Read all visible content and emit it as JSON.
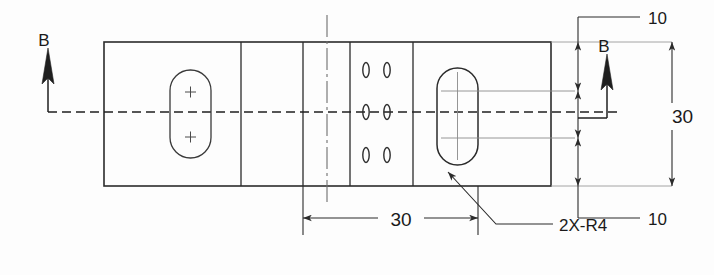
{
  "drawing": {
    "type": "engineering-drawing",
    "title": "",
    "background_color": "#fdfdfd",
    "line_color": "#2b2b2b",
    "thin_line_color": "#565656",
    "text_color": "#1a1a1a",
    "view": {
      "name": "front-view",
      "outline": {
        "x": 104,
        "y": 42,
        "width": 447,
        "height": 144
      },
      "dividers_x": [
        241,
        303,
        350,
        413
      ]
    },
    "centerlines": {
      "horizontal": {
        "y": 112,
        "x1": 48,
        "x2": 620,
        "style": "dash-dot"
      },
      "vertical": {
        "x": 327,
        "y1": 15,
        "y2": 205,
        "style": "dash-dot"
      }
    },
    "features": {
      "left_slot": {
        "label": "left-obround-slot",
        "x": 170,
        "y": 70,
        "width": 41,
        "height": 88,
        "center_marks": [
          "+",
          "+"
        ]
      },
      "right_slot": {
        "label": "right-obround-slot",
        "x": 437,
        "y": 68,
        "width": 41,
        "height": 97
      },
      "hole_grid": {
        "label": "small-slot-grid",
        "columns_x": [
          366,
          386
        ],
        "rows_y": [
          70,
          112,
          155
        ],
        "count": 6,
        "shape": "vertical-slot"
      }
    },
    "section_marks": [
      {
        "label": "B",
        "name": "section-arrow-b-left",
        "x": 48,
        "arrow_tip_y": 52,
        "arrow_base_y": 112,
        "text_x": 44,
        "text_y": 46
      },
      {
        "label": "B",
        "name": "section-arrow-b-right",
        "x": 607,
        "arrow_tip_y": 58,
        "arrow_base_y": 118,
        "text_x": 603,
        "text_y": 50
      }
    ],
    "dimensions": [
      {
        "name": "dim-top-10",
        "value": "10",
        "orientation": "vertical-leader",
        "text_x": 651,
        "text_y": 21,
        "leader": {
          "x1": 578,
          "y1": 17,
          "x2": 640,
          "y2": 17
        }
      },
      {
        "name": "dim-bottom-10",
        "value": "10",
        "orientation": "vertical-leader",
        "text_x": 651,
        "text_y": 222,
        "leader": {
          "x1": 578,
          "y1": 218,
          "x2": 640,
          "y2": 218
        }
      },
      {
        "name": "dim-overall-height-30",
        "value": "30",
        "orientation": "vertical",
        "text_x": 672,
        "text_y": 119,
        "line_x": 655,
        "y1": 42,
        "y2": 186
      },
      {
        "name": "dim-width-30",
        "value": "30",
        "orientation": "horizontal",
        "text_x": 400,
        "text_y": 222,
        "line_y": 218,
        "x1": 303,
        "x2": 478
      }
    ],
    "annotations": [
      {
        "name": "radius-callout",
        "text": "2X-R4",
        "text_x": 561,
        "text_y": 228,
        "leader_points": "448,172 496,224 553,224"
      }
    ]
  }
}
